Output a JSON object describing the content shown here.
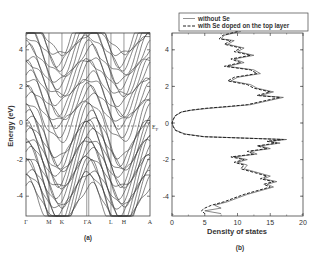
{
  "chart_data": [
    {
      "panel": "(a)",
      "type": "line",
      "title": "",
      "description": "Electronic band structure along high-symmetry path",
      "xlabel": "",
      "ylabel": "Energy (eV)",
      "ylim": [
        -5,
        5
      ],
      "yticks": [
        -4,
        -2,
        0,
        2,
        4
      ],
      "ytick_labels": [
        "-4",
        "-2",
        "0",
        "2",
        "4"
      ],
      "kpoints": [
        "Γ",
        "M",
        "K",
        "ΓA",
        "L",
        "H",
        "A"
      ],
      "kpoint_fractions": [
        0.0,
        0.185,
        0.29,
        0.49,
        0.685,
        0.79,
        1.0
      ],
      "fermi_level": {
        "energy": 0,
        "label": "E_F",
        "style": "dashed"
      },
      "grid": false
    },
    {
      "panel": "(b)",
      "type": "line",
      "title": "",
      "xlabel": "Density of states",
      "ylabel": "",
      "xlim": [
        0,
        20
      ],
      "ylim": [
        -5,
        5
      ],
      "xticks": [
        0,
        5,
        10,
        15,
        20
      ],
      "xtick_labels": [
        "0",
        "5",
        "10",
        "15",
        "20"
      ],
      "yticks": [
        -4,
        -2,
        0,
        2,
        4
      ],
      "ytick_labels": [
        "-4",
        "-2",
        "0",
        "2",
        "4"
      ],
      "legend": {
        "position": "top",
        "entries": [
          "without Se",
          "with Se doped on the top layer"
        ]
      },
      "energy": [
        5.0,
        4.8,
        4.6,
        4.5,
        4.3,
        4.1,
        3.9,
        3.7,
        3.5,
        3.3,
        3.1,
        2.9,
        2.7,
        2.5,
        2.3,
        2.1,
        1.9,
        1.7,
        1.5,
        1.4,
        1.2,
        1.0,
        0.9,
        0.8,
        0.7,
        0.6,
        0.4,
        0.2,
        0.0,
        -0.2,
        -0.4,
        -0.6,
        -0.75,
        -0.9,
        -1.0,
        -1.1,
        -1.25,
        -1.4,
        -1.55,
        -1.7,
        -1.85,
        -2.0,
        -2.15,
        -2.3,
        -2.5,
        -2.7,
        -2.9,
        -3.05,
        -3.2,
        -3.35,
        -3.5,
        -3.7,
        -3.9,
        -4.1,
        -4.3,
        -4.5,
        -4.65,
        -4.8,
        -4.95
      ],
      "series": [
        {
          "name": "without Se",
          "style": "solid",
          "values": [
            10.5,
            8.0,
            7.5,
            9.5,
            8.5,
            11.0,
            10.0,
            12.5,
            9.5,
            11.0,
            8.5,
            12.5,
            13.5,
            10.0,
            9.0,
            12.0,
            13.0,
            15.5,
            13.5,
            17.0,
            14.5,
            12.0,
            9.0,
            5.5,
            3.0,
            1.5,
            0.5,
            0.2,
            0.0,
            0.2,
            0.6,
            2.0,
            5.0,
            17.5,
            15.0,
            16.5,
            13.5,
            15.0,
            12.0,
            13.0,
            9.5,
            11.5,
            10.0,
            11.5,
            11.0,
            13.0,
            15.0,
            14.0,
            16.0,
            14.5,
            15.5,
            13.5,
            11.5,
            10.0,
            8.5,
            6.5,
            7.5,
            5.0,
            7.5
          ]
        },
        {
          "name": "with Se doped on the top layer",
          "style": "dashed",
          "values": [
            10.0,
            7.8,
            7.2,
            9.0,
            8.0,
            10.5,
            9.5,
            12.0,
            9.0,
            10.5,
            8.0,
            12.0,
            13.0,
            9.5,
            8.5,
            11.5,
            12.5,
            15.0,
            13.0,
            16.5,
            14.0,
            11.5,
            8.5,
            5.0,
            2.8,
            1.4,
            0.5,
            0.2,
            0.0,
            0.2,
            0.5,
            1.8,
            4.8,
            17.0,
            14.5,
            16.0,
            13.0,
            14.5,
            11.5,
            12.5,
            9.0,
            11.0,
            9.5,
            11.0,
            10.5,
            12.5,
            14.5,
            13.5,
            15.5,
            14.0,
            15.0,
            13.0,
            11.0,
            9.5,
            8.0,
            6.0,
            5.0,
            4.5,
            5.0
          ]
        }
      ]
    }
  ],
  "figure": {
    "panel_a_label": "(a)",
    "panel_b_label": "(b)",
    "band_ylabel": "Energy (eV)",
    "fermi_label": "E",
    "fermi_subscript": "F",
    "dos_xlabel": "Density of states",
    "legend_solid": "without Se",
    "legend_dashed": "with Se doped on the top layer",
    "band_yticks": [
      "4",
      "2",
      "0",
      "-2",
      "-4"
    ],
    "dos_yticks": [
      "4",
      "2",
      "0",
      "-2",
      "-4"
    ],
    "dos_xticks": [
      "0",
      "5",
      "10",
      "15",
      "20"
    ],
    "kpoints": [
      "Γ",
      "M",
      "K",
      "ΓA",
      "L",
      "H",
      "A"
    ]
  },
  "colors": {
    "line": "#333333",
    "frame": "#444444",
    "background": "#ffffff"
  }
}
